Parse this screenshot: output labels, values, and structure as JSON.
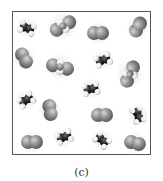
{
  "figure": {
    "caption": "(c)",
    "border_color": "#555555",
    "colors": {
      "gray_atom": "#8a8a8a",
      "gray_atom_light": "#c8c8c8",
      "black_atom": "#1e1e1e",
      "white_atom": "#f2f2f2"
    },
    "molecules": [
      {
        "type": "ethylene",
        "x": 27,
        "y": 28,
        "angle": 20
      },
      {
        "type": "chloro-large",
        "x": 63,
        "y": 26,
        "angle": -15
      },
      {
        "type": "diatomic",
        "x": 98,
        "y": 33,
        "angle": 0
      },
      {
        "type": "diatomic",
        "x": 138,
        "y": 27,
        "angle": -60
      },
      {
        "type": "diatomic",
        "x": 24,
        "y": 58,
        "angle": 60
      },
      {
        "type": "chloro-large",
        "x": 60,
        "y": 67,
        "angle": 30
      },
      {
        "type": "ethylene",
        "x": 103,
        "y": 60,
        "angle": -20
      },
      {
        "type": "chloro-large",
        "x": 130,
        "y": 74,
        "angle": -50
      },
      {
        "type": "ethylene",
        "x": 91,
        "y": 89,
        "angle": -10
      },
      {
        "type": "ethylene",
        "x": 26,
        "y": 100,
        "angle": -30
      },
      {
        "type": "diatomic",
        "x": 50,
        "y": 110,
        "angle": 80
      },
      {
        "type": "diatomic",
        "x": 102,
        "y": 115,
        "angle": 0
      },
      {
        "type": "ethylene",
        "x": 138,
        "y": 115,
        "angle": 70
      },
      {
        "type": "diatomic",
        "x": 32,
        "y": 142,
        "angle": 0
      },
      {
        "type": "ethylene",
        "x": 64,
        "y": 137,
        "angle": -20
      },
      {
        "type": "ethylene",
        "x": 102,
        "y": 140,
        "angle": 40
      },
      {
        "type": "diatomic",
        "x": 135,
        "y": 143,
        "angle": 15
      }
    ]
  }
}
